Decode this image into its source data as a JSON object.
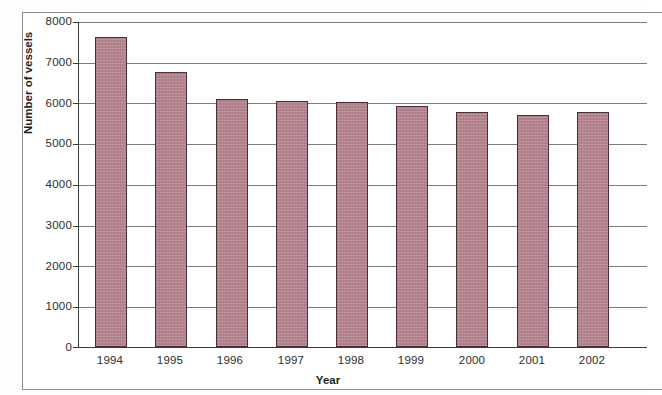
{
  "chart_data": {
    "type": "bar",
    "title": "",
    "xlabel": "Year",
    "ylabel": "Number of vessels",
    "categories": [
      "1994",
      "1995",
      "1996",
      "1997",
      "1998",
      "1999",
      "2000",
      "2001",
      "2002"
    ],
    "values": [
      7600,
      6750,
      6080,
      6030,
      6020,
      5920,
      5760,
      5700,
      5770
    ],
    "series": [
      {
        "name": "Number of vessels",
        "values": [
          7600,
          6750,
          6080,
          6030,
          6020,
          5920,
          5760,
          5700,
          5770
        ]
      }
    ],
    "ylim": [
      0,
      8000
    ],
    "ytick_labels": [
      "8000",
      "7000",
      "6000",
      "5000",
      "4000",
      "3000",
      "2000",
      "1000",
      "0"
    ],
    "ytick_values": [
      8000,
      7000,
      6000,
      5000,
      4000,
      3000,
      2000,
      1000,
      0
    ],
    "ytick_interval": 1000,
    "grid": "horizontal",
    "legend": "none",
    "bar_color": "#b5838d",
    "bar_border_color": "#4a3036",
    "gridline_color": "#7a7a7a",
    "axis_color": "#3b3b3b",
    "note": "right edge of plot area is cropped by the image boundary"
  }
}
